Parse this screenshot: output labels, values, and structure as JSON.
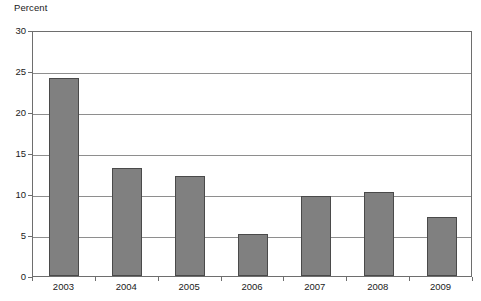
{
  "chart_data": {
    "type": "bar",
    "title": "",
    "subtitle": "",
    "xlabel": "",
    "ylabel": "Percent",
    "categories": [
      "2003",
      "2004",
      "2005",
      "2006",
      "2007",
      "2008",
      "2009"
    ],
    "values": [
      24.2,
      13.2,
      12.2,
      5.1,
      9.8,
      10.2,
      7.2
    ],
    "ylim": [
      0,
      30
    ],
    "ytick_values": [
      0,
      5,
      10,
      15,
      20,
      25,
      30
    ],
    "ytick_labels": [
      "0",
      "5",
      "10",
      "15",
      "20",
      "25",
      "30"
    ],
    "grid": true,
    "grid_axis": "y",
    "legend": false,
    "legend_position": "none",
    "bar_color": "#808080",
    "bar_edge_color": "#4a4a4a",
    "gridline_color": "#8e8e8e",
    "axis_color": "#6e6e6e",
    "text_color": "#1a1a1a",
    "background_color": "#ffffff"
  }
}
